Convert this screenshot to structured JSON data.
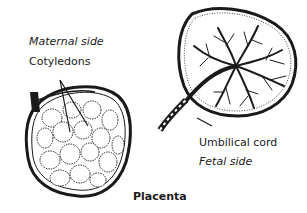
{
  "diagram": {
    "title": "Placenta",
    "labels": {
      "maternal_side": "Maternal side",
      "cotyledons": "Cotyledons",
      "umbilical_cord": "Umbilical cord",
      "fetal_side": "Fetal side"
    },
    "colors": {
      "ink": "#1a1a1a",
      "background": "#ffffff"
    }
  }
}
